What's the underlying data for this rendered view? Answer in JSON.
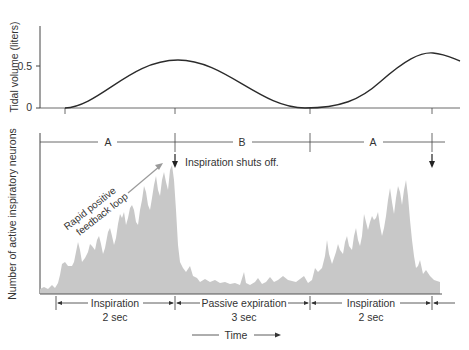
{
  "upper_plot": {
    "ylabel": "Tidal volume (liters)",
    "ticks": [
      "0.5",
      "0"
    ],
    "tick_values": [
      0.5,
      0
    ]
  },
  "lower_plot": {
    "ylabel": "Number of  active inspiratory neurons",
    "phase_labels": [
      "A",
      "B",
      "A"
    ],
    "annotation_shutoff": "Inspiration shuts off.",
    "annotation_feedback_line1": "Rapid positive",
    "annotation_feedback_line2": "feedback loop"
  },
  "time_axis": {
    "segments": [
      {
        "label": "Inspiration",
        "duration": "2 sec"
      },
      {
        "label": "Passive expiration",
        "duration": "3 sec"
      },
      {
        "label": "Inspiration",
        "duration": "2 sec"
      }
    ],
    "label": "Time"
  },
  "colors": {
    "line": "#2b2b2b",
    "fill": "#c8c8c8",
    "arrow_gray": "#9a9a9a"
  }
}
